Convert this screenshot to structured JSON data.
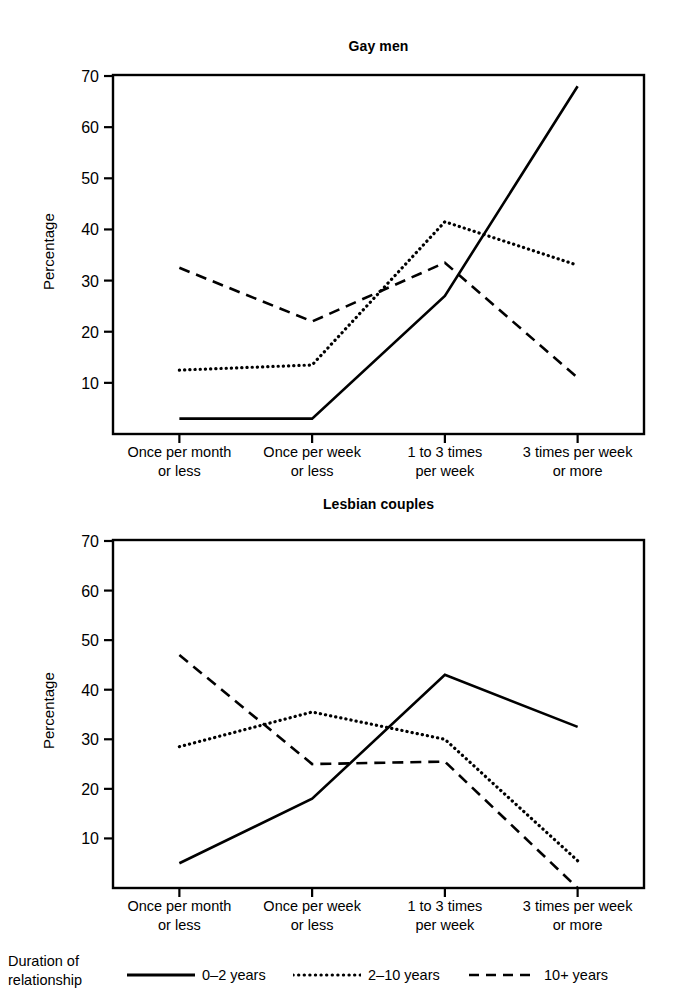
{
  "figure": {
    "ylabel": "Percentage",
    "categories": [
      [
        "Once per month",
        "or less"
      ],
      [
        "Once per week",
        "or less"
      ],
      [
        "1 to 3 times",
        "per week"
      ],
      [
        "3 times per week",
        "or more"
      ]
    ],
    "yticks": [
      10,
      20,
      30,
      40,
      50,
      60,
      70
    ],
    "ylim": [
      0,
      70
    ]
  },
  "legend": {
    "title_line1": "Duration of",
    "title_line2": "relationship",
    "entries": [
      {
        "label": "0–2 years",
        "style": "solid"
      },
      {
        "label": "2–10 years",
        "style": "dotted"
      },
      {
        "label": "10+ years",
        "style": "dashed"
      }
    ]
  },
  "chart_data": [
    {
      "type": "line",
      "title": "Gay men",
      "xlabel": "",
      "ylabel": "Percentage",
      "ylim": [
        0,
        70
      ],
      "yticks": [
        10,
        20,
        30,
        40,
        50,
        60,
        70
      ],
      "grid": false,
      "legend_position": "bottom",
      "categories": [
        "Once per month or less",
        "Once per week or less",
        "1 to 3 times per week",
        "3 times per week or more"
      ],
      "series": [
        {
          "name": "0–2 years",
          "style": "solid",
          "values": [
            3,
            3,
            27,
            68
          ]
        },
        {
          "name": "2–10 years",
          "style": "dotted",
          "values": [
            12.5,
            13.5,
            41.5,
            33
          ]
        },
        {
          "name": "10+ years",
          "style": "dashed",
          "values": [
            32.5,
            22,
            33.5,
            11
          ]
        }
      ]
    },
    {
      "type": "line",
      "title": "Lesbian couples",
      "xlabel": "",
      "ylabel": "Percentage",
      "ylim": [
        0,
        70
      ],
      "yticks": [
        10,
        20,
        30,
        40,
        50,
        60,
        70
      ],
      "grid": false,
      "legend_position": "bottom",
      "categories": [
        "Once per month or less",
        "Once per week or less",
        "1 to 3 times per week",
        "3 times per week or more"
      ],
      "series": [
        {
          "name": "0–2 years",
          "style": "solid",
          "values": [
            5,
            18,
            43,
            32.5
          ]
        },
        {
          "name": "2–10 years",
          "style": "dotted",
          "values": [
            28.5,
            35.5,
            30,
            5.5
          ]
        },
        {
          "name": "10+ years",
          "style": "dashed",
          "values": [
            47,
            25,
            25.5,
            0
          ]
        }
      ]
    }
  ],
  "colors": {
    "line": "#000000",
    "axis": "#000000",
    "background": "#ffffff"
  }
}
